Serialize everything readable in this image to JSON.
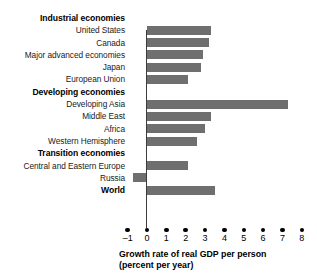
{
  "chart_data": {
    "type": "bar",
    "orientation": "horizontal",
    "title": "",
    "xlabel": "Growth rate of real GDP per person (percent per year)",
    "ylabel": "",
    "xlim": [
      -1,
      8
    ],
    "xticks": [
      -1,
      0,
      1,
      2,
      3,
      4,
      5,
      6,
      7,
      8
    ],
    "xtick_labels": [
      "–1",
      "0",
      "1",
      "2",
      "3",
      "4",
      "5",
      "6",
      "7",
      "8"
    ],
    "grid": false,
    "legend": false,
    "bar_color": "#706f6f",
    "zero_line_color": "#3d3d3d",
    "categories": [
      "Industrial economies",
      "United States",
      "Canada",
      "Major advanced economies",
      "Japan",
      "European Union",
      "Developing economies",
      "Developing Asia",
      "Middle East",
      "Africa",
      "Western Hemisphere",
      "Transition economies",
      "Central and Eastern Europe",
      "Russia",
      "World"
    ],
    "values": [
      null,
      3.3,
      3.2,
      2.9,
      2.8,
      2.1,
      null,
      7.3,
      3.3,
      3.0,
      2.6,
      null,
      2.1,
      -0.7,
      3.5
    ],
    "rows": [
      {
        "label": "Industrial economies",
        "value": null,
        "is_header": true
      },
      {
        "label": "United States",
        "value": 3.3,
        "is_header": false
      },
      {
        "label": "Canada",
        "value": 3.2,
        "is_header": false
      },
      {
        "label": "Major advanced economies",
        "value": 2.9,
        "is_header": false
      },
      {
        "label": "Japan",
        "value": 2.8,
        "is_header": false
      },
      {
        "label": "European Union",
        "value": 2.1,
        "is_header": false
      },
      {
        "label": "Developing economies",
        "value": null,
        "is_header": true
      },
      {
        "label": "Developing Asia",
        "value": 7.3,
        "is_header": false
      },
      {
        "label": "Middle East",
        "value": 3.3,
        "is_header": false
      },
      {
        "label": "Africa",
        "value": 3.0,
        "is_header": false
      },
      {
        "label": "Western Hemisphere",
        "value": 2.6,
        "is_header": false
      },
      {
        "label": "Transition economies",
        "value": null,
        "is_header": true
      },
      {
        "label": "Central and Eastern Europe",
        "value": 2.1,
        "is_header": false
      },
      {
        "label": "Russia",
        "value": -0.7,
        "is_header": false
      },
      {
        "label": "World",
        "value": 3.5,
        "is_header": true
      }
    ],
    "axis_title_lines": [
      "Growth rate of real GDP per person",
      "(percent per year)"
    ]
  }
}
